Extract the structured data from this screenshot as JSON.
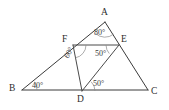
{
  "figure": {
    "type": "geometry-diagram",
    "canvas": {
      "width": 169,
      "height": 110,
      "background": "#ffffff"
    },
    "stroke_color": "#3b3b3b",
    "arc_color": "#8a8a8a",
    "label_color": "#2c2c2c",
    "vertices": [
      {
        "id": "A",
        "label": "A",
        "x": 105,
        "y": 22,
        "label_x": 101,
        "label_y": 8
      },
      {
        "id": "B",
        "label": "B",
        "x": 22,
        "y": 90,
        "label_x": 9,
        "label_y": 84
      },
      {
        "id": "C",
        "label": "C",
        "x": 148,
        "y": 90,
        "label_x": 151,
        "label_y": 87
      },
      {
        "id": "D",
        "label": "D",
        "x": 82,
        "y": 91,
        "label_x": 77,
        "label_y": 95
      },
      {
        "id": "E",
        "label": "E",
        "x": 119,
        "y": 45,
        "label_x": 121,
        "label_y": 35
      },
      {
        "id": "F",
        "label": "F",
        "x": 73,
        "y": 45,
        "label_x": 62,
        "label_y": 35
      }
    ],
    "segments": [
      {
        "id": "AB",
        "from": "A",
        "to": "B"
      },
      {
        "id": "BC",
        "from": "B",
        "to": "C"
      },
      {
        "id": "AC",
        "from": "A",
        "to": "C"
      },
      {
        "id": "FE",
        "from": "F",
        "to": "E"
      },
      {
        "id": "FD",
        "from": "F",
        "to": "D"
      },
      {
        "id": "DE",
        "from": "D",
        "to": "E"
      }
    ],
    "angles": [
      {
        "id": "angle-A",
        "vertex": "A",
        "value": "80°",
        "label_x": 94,
        "label_y": 29
      },
      {
        "id": "angle-B",
        "vertex": "B",
        "value": "40°",
        "label_x": 32,
        "label_y": 82
      },
      {
        "id": "angle-F",
        "vertex": "F",
        "value": "60°",
        "label_x": 63,
        "label_y": 56
      },
      {
        "id": "angle-E",
        "vertex": "E",
        "value": "50°",
        "label_x": 95,
        "label_y": 50
      },
      {
        "id": "angle-D",
        "vertex": "D",
        "value": "50°",
        "label_x": 93,
        "label_y": 80
      }
    ]
  }
}
